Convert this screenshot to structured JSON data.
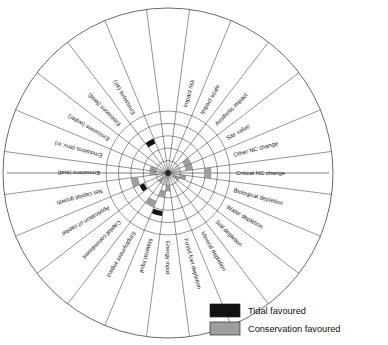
{
  "chart_data": {
    "type": "bar",
    "subtype": "radial-wind-rose",
    "title": "",
    "xlabel": "",
    "ylabel": "",
    "categories": [
      "Impact risk",
      "Impact scale",
      "Aesthetic impact",
      "Site value",
      "Other NC change",
      "Critical NC change",
      "Biological depletion",
      "Water depletion",
      "Soil depletion",
      "Mineral depletion",
      "Fossil fuel depletion",
      "Energy input",
      "Material input",
      "Employment impact",
      "Capital commitment",
      "Application of capital",
      "Net capital growth",
      "Emissions (aud)",
      "Emissions (env. in)",
      "Emissions (water)",
      "Emissions (land)",
      "Emissions (air)"
    ],
    "series": [
      {
        "name": "Tidal favoured",
        "color": "#121212",
        "values": [
          0,
          0,
          0,
          0,
          0,
          0,
          0,
          0,
          0,
          0,
          0,
          0,
          3.5,
          0,
          0,
          2.5,
          0,
          0,
          0,
          0,
          0,
          3.0
        ]
      },
      {
        "name": "Conservation favoured",
        "color": "#9e9e9e",
        "values": [
          0,
          0,
          0,
          2.0,
          2.0,
          3.5,
          1.5,
          1.0,
          0,
          0,
          0,
          1.5,
          2.0,
          3.0,
          1.0,
          0,
          3.0,
          1.5,
          1.5,
          0,
          0,
          0
        ]
      }
    ],
    "radial_axis": {
      "rings": 5,
      "grid": true,
      "range": [
        0,
        5
      ]
    },
    "legend_position": "bottom-right"
  },
  "legend": {
    "items": [
      {
        "label": "Tidal favoured",
        "color": "#121212"
      },
      {
        "label": "Conservation favoured",
        "color": "#9e9e9e"
      }
    ]
  },
  "geometry": {
    "cx": 168,
    "cy": 173,
    "outer_radius": 165,
    "label_ring_inner": 62,
    "data_max_radius": 62,
    "spoke_count": 24
  }
}
